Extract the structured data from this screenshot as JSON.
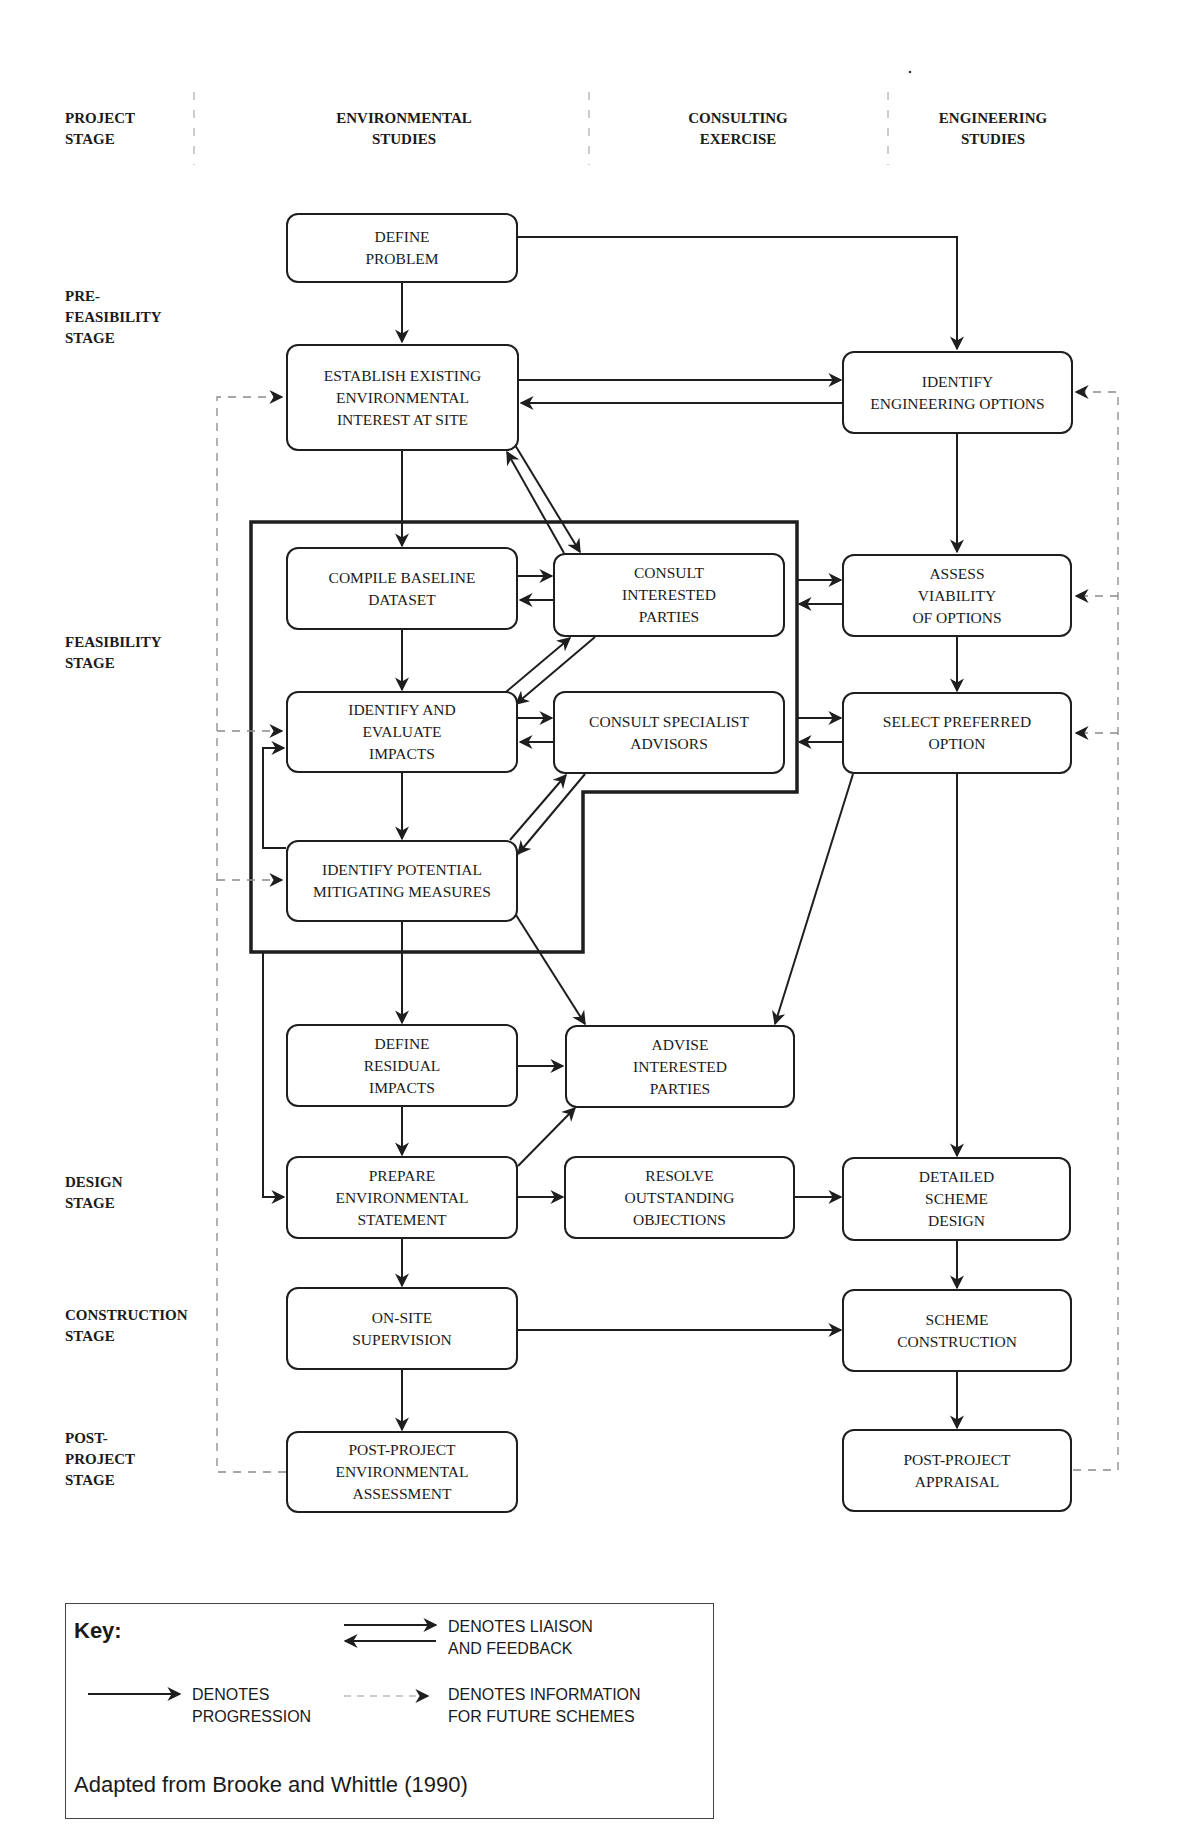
{
  "headers": {
    "project_stage": "PROJECT\nSTAGE",
    "environmental_studies": "ENVIRONMENTAL\nSTUDIES",
    "consulting_exercise": "CONSULTING\nEXERCISE",
    "engineering_studies": "ENGINEERING\nSTUDIES"
  },
  "stages": {
    "pre_feasibility": "PRE-\nFEASIBILITY\nSTAGE",
    "feasibility": "FEASIBILITY\nSTAGE",
    "design": "DESIGN\nSTAGE",
    "construction": "CONSTRUCTION\nSTAGE",
    "post_project": "POST-\nPROJECT\nSTAGE"
  },
  "nodes": {
    "define_problem": "DEFINE\nPROBLEM",
    "establish_existing": "ESTABLISH EXISTING\nENVIRONMENTAL\nINTEREST AT SITE",
    "identify_engineering_options": "IDENTIFY\nENGINEERING OPTIONS",
    "compile_baseline": "COMPILE BASELINE\nDATASET",
    "consult_interested": "CONSULT\nINTERESTED\nPARTIES",
    "assess_viability": "ASSESS\nVIABILITY\nOF OPTIONS",
    "identify_evaluate": "IDENTIFY AND\nEVALUATE\nIMPACTS",
    "consult_specialist": "CONSULT SPECIALIST\nADVISORS",
    "select_preferred": "SELECT PREFERRED\nOPTION",
    "identify_mitigating": "IDENTIFY POTENTIAL\nMITIGATING MEASURES",
    "define_residual": "DEFINE\nRESIDUAL\nIMPACTS",
    "advise_interested": "ADVISE\nINTERESTED\nPARTIES",
    "prepare_statement": "PREPARE\nENVIRONMENTAL\nSTATEMENT",
    "resolve_objections": "RESOLVE\nOUTSTANDING\nOBJECTIONS",
    "detailed_design": "DETAILED\nSCHEME\nDESIGN",
    "onsite_supervision": "ON-SITE\nSUPERVISION",
    "scheme_construction": "SCHEME\nCONSTRUCTION",
    "post_env_assessment": "POST-PROJECT\nENVIRONMENTAL\nASSESSMENT",
    "post_appraisal": "POST-PROJECT\nAPPRAISAL"
  },
  "key": {
    "title": "Key:",
    "liaison": "DENOTES LIAISON\nAND FEEDBACK",
    "progression": "DENOTES\nPROGRESSION",
    "information": "DENOTES INFORMATION\nFOR FUTURE SCHEMES",
    "source": "Adapted from Brooke and Whittle (1990)"
  },
  "colors": {
    "line": "#1e1e1e",
    "dashed": "#8a8a8a",
    "background": "#ffffff"
  }
}
